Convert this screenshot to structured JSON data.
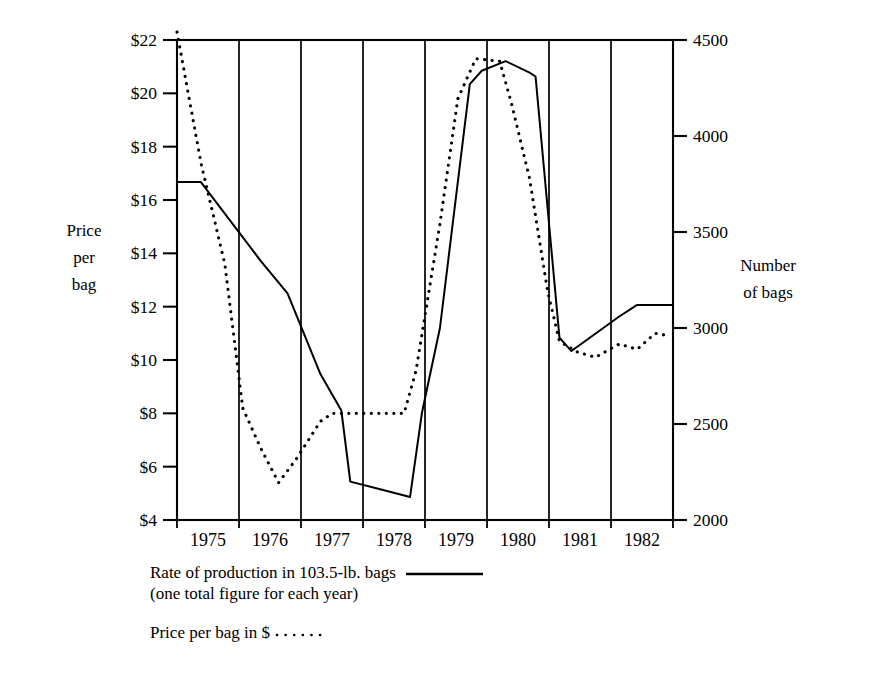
{
  "chart_data": {
    "type": "line",
    "title": "",
    "xlabel": "",
    "ylabel": "Price per bag",
    "y2label": "Number of bags",
    "grid": true,
    "legend_position": "below",
    "x": [
      1975,
      1976,
      1977,
      1978,
      1979,
      1980,
      1981,
      1982
    ],
    "categories": [
      "1975",
      "1976",
      "1977",
      "1978",
      "1979",
      "1980",
      "1981",
      "1982"
    ],
    "yticks_left": [
      "$4",
      "$6",
      "$8",
      "$10",
      "$12",
      "$14",
      "$16",
      "$18",
      "$20",
      "$22"
    ],
    "ytick_values_left": [
      4,
      6,
      8,
      10,
      12,
      14,
      16,
      18,
      20,
      22
    ],
    "ylim_left": [
      4,
      22
    ],
    "yticks_right": [
      "2000",
      "2500",
      "3000",
      "3500",
      "4000",
      "4500"
    ],
    "ytick_values_right": [
      2000,
      2500,
      3000,
      3500,
      4000,
      4500
    ],
    "ylim_right": [
      2000,
      4500
    ],
    "series": [
      {
        "name": "Rate of production in 103.5-lb. bags",
        "style": "solid",
        "axis": "right",
        "units": "bags",
        "points": [
          {
            "year": 1974.6,
            "value": 3760
          },
          {
            "year": 1975.0,
            "value": 3760
          },
          {
            "year": 1976.0,
            "value": 3350
          },
          {
            "year": 1976.45,
            "value": 3180
          },
          {
            "year": 1977.0,
            "value": 2760
          },
          {
            "year": 1977.35,
            "value": 2570
          },
          {
            "year": 1977.5,
            "value": 2200
          },
          {
            "year": 1978.0,
            "value": 2160
          },
          {
            "year": 1978.5,
            "value": 2120
          },
          {
            "year": 1978.7,
            "value": 2560
          },
          {
            "year": 1979.0,
            "value": 3000
          },
          {
            "year": 1979.5,
            "value": 4270
          },
          {
            "year": 1979.7,
            "value": 4340
          },
          {
            "year": 1980.1,
            "value": 4390
          },
          {
            "year": 1980.5,
            "value": 4330
          },
          {
            "year": 1980.6,
            "value": 4310
          },
          {
            "year": 1981.0,
            "value": 2950
          },
          {
            "year": 1981.2,
            "value": 2880
          },
          {
            "year": 1982.0,
            "value": 3060
          },
          {
            "year": 1982.3,
            "value": 3120
          },
          {
            "year": 1982.9,
            "value": 3120
          }
        ]
      },
      {
        "name": "Price per bag in $",
        "style": "dotted",
        "axis": "left",
        "units": "dollars",
        "points": [
          {
            "year": 1974.6,
            "value": 22.3
          },
          {
            "year": 1975.0,
            "value": 17.4
          },
          {
            "year": 1975.4,
            "value": 13.6
          },
          {
            "year": 1975.7,
            "value": 8.2
          },
          {
            "year": 1976.0,
            "value": 6.7
          },
          {
            "year": 1976.3,
            "value": 5.4
          },
          {
            "year": 1976.6,
            "value": 6.3
          },
          {
            "year": 1977.0,
            "value": 7.7
          },
          {
            "year": 1977.2,
            "value": 8.0
          },
          {
            "year": 1978.4,
            "value": 8.0
          },
          {
            "year": 1978.6,
            "value": 9.6
          },
          {
            "year": 1979.0,
            "value": 15.1
          },
          {
            "year": 1979.3,
            "value": 19.8
          },
          {
            "year": 1979.6,
            "value": 21.3
          },
          {
            "year": 1980.0,
            "value": 21.2
          },
          {
            "year": 1980.2,
            "value": 19.6
          },
          {
            "year": 1980.5,
            "value": 16.8
          },
          {
            "year": 1980.8,
            "value": 12.6
          },
          {
            "year": 1981.0,
            "value": 10.7
          },
          {
            "year": 1981.3,
            "value": 10.3
          },
          {
            "year": 1981.6,
            "value": 10.1
          },
          {
            "year": 1982.0,
            "value": 10.6
          },
          {
            "year": 1982.3,
            "value": 10.4
          },
          {
            "year": 1982.6,
            "value": 11.0
          },
          {
            "year": 1982.85,
            "value": 10.9
          }
        ]
      }
    ],
    "legend": [
      {
        "label": "Rate of production in 103.5-lb. bags",
        "sublabel": "(one total figure for each year)",
        "style": "solid"
      },
      {
        "label": "Price per bag in $",
        "sublabel": "",
        "style": "dotted"
      }
    ]
  },
  "axes": {
    "left_title_lines": [
      "Price",
      "per",
      "bag"
    ],
    "right_title_lines": [
      "Number",
      "of bags"
    ]
  },
  "colors": {
    "ink": "#000000",
    "background": "#ffffff"
  }
}
